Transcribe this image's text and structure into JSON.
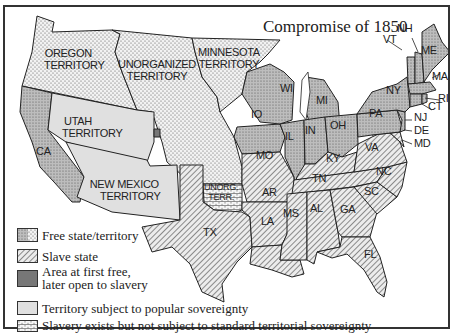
{
  "map": {
    "title": "Compromise of 1850",
    "colors": {
      "free": "#c8c8c8",
      "free_dots": "#555555",
      "slave_bg": "#e8e8e8",
      "slave_hatch": "#555555",
      "area_first_free": "#777777",
      "popular_sovereignty": "#e3e3e3",
      "unorganized_bg": "#f4f4f4",
      "border": "#222222"
    },
    "territories": {
      "oregon": [
        "OREGON",
        "TERRITORY"
      ],
      "unorganized": [
        "UNORGANIZED",
        "TERRITORY"
      ],
      "minnesota": [
        "MINNESOTA",
        "TERRITORY"
      ],
      "utah": [
        "UTAH",
        "TERRITORY"
      ],
      "new_mexico": [
        "NEW MEXICO",
        "TERRITORY"
      ],
      "unorg_terr": [
        "UNORG.",
        "TERR."
      ]
    },
    "states": {
      "CA": "CA",
      "TX": "TX",
      "LA": "LA",
      "MS": "MS",
      "AL": "AL",
      "GA": "GA",
      "FL": "FL",
      "AR": "AR",
      "MO": "MO",
      "TN": "TN",
      "KY": "KY",
      "NC": "NC",
      "SC": "SC",
      "VA": "VA",
      "MD": "MD",
      "DE": "DE",
      "NJ": "NJ",
      "PA": "PA",
      "NY": "NY",
      "CT": "CT",
      "RI": "RI",
      "MA": "MA",
      "VT": "VT",
      "NH": "NH",
      "ME": "ME",
      "OH": "OH",
      "IN": "IN",
      "IL": "IL",
      "MI": "MI",
      "WI": "WI",
      "IO": "IO"
    },
    "legend": [
      {
        "key": "free",
        "label": "Free state/territory"
      },
      {
        "key": "slave",
        "label": "Slave state"
      },
      {
        "key": "area_first_free",
        "label_line1": "Area at first free,",
        "label_line2": "later open to slavery"
      },
      {
        "key": "popular_sovereignty",
        "label": "Territory subject to popular sovereignty"
      },
      {
        "key": "unorganized",
        "label": "Slavery exists but not subject to standard territorial sovereignty"
      }
    ]
  }
}
